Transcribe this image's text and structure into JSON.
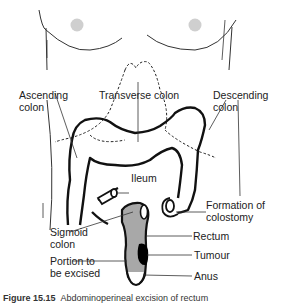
{
  "figure": {
    "caption_label": "Figure 15.15",
    "caption_text": "Abdominoperineal excision of rectum"
  },
  "labels": {
    "ascending_colon": [
      "Ascending",
      "colon"
    ],
    "transverse_colon": "Transverse colon",
    "descending_colon": [
      "Descending",
      "colon"
    ],
    "ileum": "Ileum",
    "formation_of_colostomy": [
      "Formation of",
      "colostomy"
    ],
    "sigmoid_colon": [
      "Sigmoid",
      "colon"
    ],
    "rectum": "Rectum",
    "portion_to_be_excised": [
      "Portion to",
      "be excised"
    ],
    "tumour": "Tumour",
    "anus": "Anus"
  },
  "colors": {
    "outline": "#111111",
    "excised_fill": "#a8a8a8",
    "tumour_fill": "#000000",
    "nipple": "#cfcfcf",
    "leader": "#333333"
  }
}
